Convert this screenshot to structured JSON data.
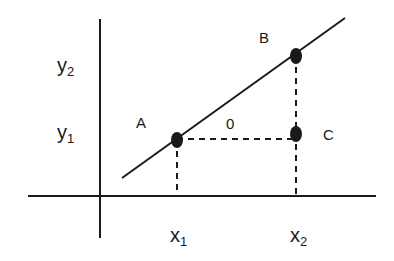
{
  "diagram": {
    "type": "coordinate-slope-diagram",
    "colors": {
      "ink": "#1a1a1a",
      "background": "#ffffff"
    },
    "axes": {
      "y_axis": {
        "x": 100,
        "y_top": 19,
        "y_bottom": 238
      },
      "x_axis": {
        "y": 196,
        "x_left": 28,
        "x_right": 376
      }
    },
    "line": {
      "x1": 122,
      "y1": 178,
      "x2": 345,
      "y2": 18
    },
    "points": [
      {
        "name": "A",
        "label": "A",
        "cx": 177,
        "cy": 140,
        "label_x": 136,
        "label_y": 128
      },
      {
        "name": "B",
        "label": "B",
        "cx": 296,
        "cy": 56,
        "label_x": 259,
        "label_y": 43
      },
      {
        "name": "C",
        "label": "C",
        "cx": 296,
        "cy": 134,
        "label_x": 323,
        "label_y": 140
      }
    ],
    "interior_label": {
      "text": "0",
      "x": 226,
      "y": 129
    },
    "y_labels": [
      {
        "base": "y",
        "sub": "2",
        "x": 57,
        "y": 72
      },
      {
        "base": "y",
        "sub": "1",
        "x": 57,
        "y": 139
      }
    ],
    "x_labels": [
      {
        "base": "x",
        "sub": "1",
        "x": 170,
        "y": 242
      },
      {
        "base": "x",
        "sub": "2",
        "x": 290,
        "y": 242
      }
    ],
    "dashed_lines": [
      {
        "from": "A",
        "x1": 177,
        "y1": 140,
        "x2": 177,
        "y2": 196
      },
      {
        "from": "B",
        "x1": 296,
        "y1": 56,
        "x2": 296,
        "y2": 196
      },
      {
        "from": "A-to-C",
        "x1": 177,
        "y1": 139,
        "x2": 296,
        "y2": 139
      }
    ]
  }
}
